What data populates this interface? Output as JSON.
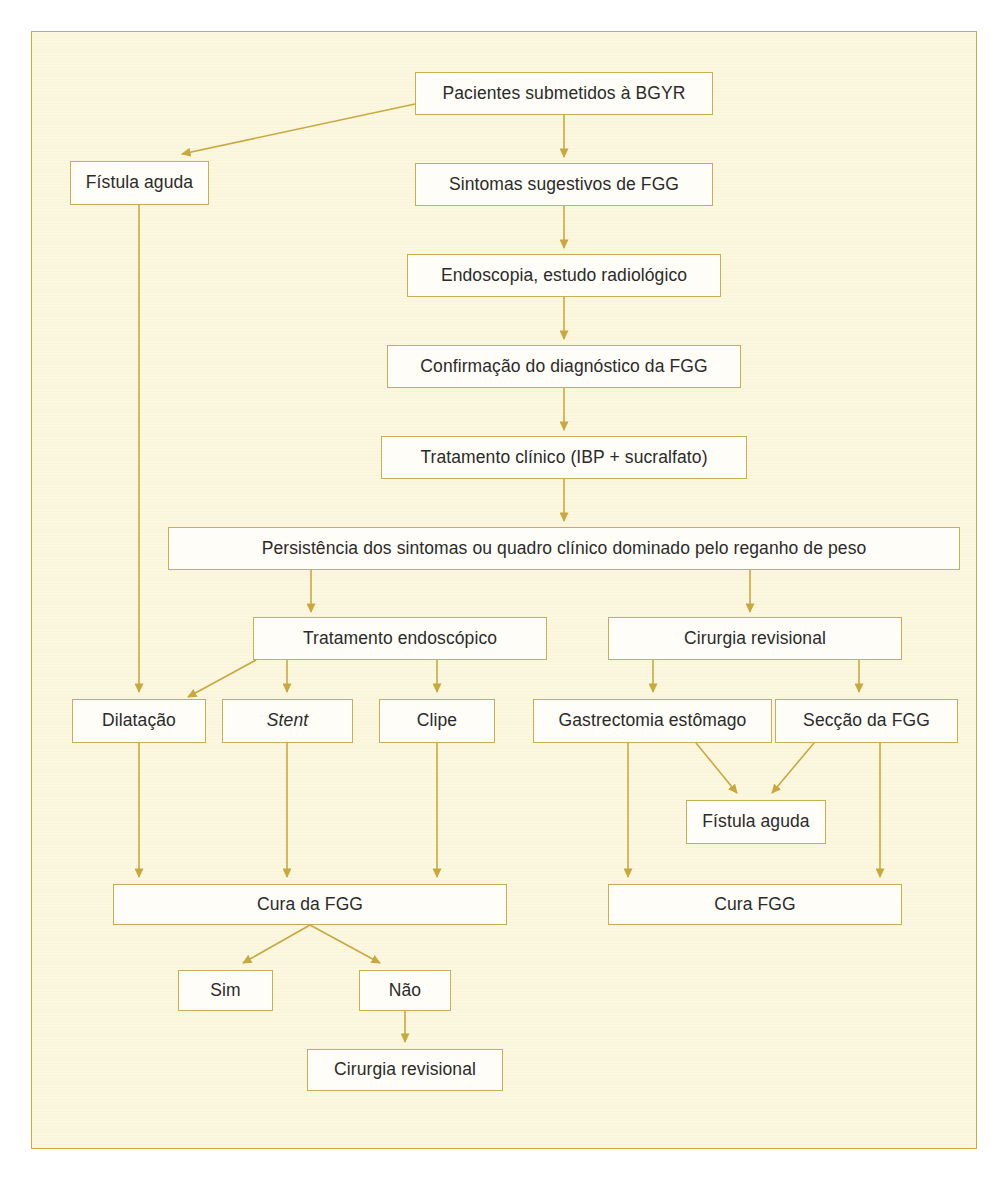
{
  "figure": {
    "kind": "clinical-flowchart",
    "language": "pt-BR",
    "palette": {
      "page_background": "#ffffff",
      "panel_background": "#fcf7df",
      "frame_border": "#c8ad4e",
      "node_fill": "#fffdf7",
      "node_border": "#c9ae55",
      "connector": "#c9a93f",
      "text": "#2b2b2b"
    }
  },
  "nodes": [
    {
      "id": "pacientes",
      "label": "Pacientes submetidos à BGYR"
    },
    {
      "id": "fistula_aguda_top",
      "label": "Fístula aguda"
    },
    {
      "id": "sintomas",
      "label": "Sintomas sugestivos de FGG"
    },
    {
      "id": "endoscopia",
      "label": "Endoscopia, estudo radiológico"
    },
    {
      "id": "confirmacao",
      "label": "Confirmação do diagnóstico da FGG"
    },
    {
      "id": "tratamento_clinico",
      "label": "Tratamento clínico (IBP + sucralfato)"
    },
    {
      "id": "persistencia",
      "label": "Persistência dos sintomas ou quadro clínico dominado pelo reganho de peso"
    },
    {
      "id": "trat_endoscopico",
      "label": "Tratamento endoscópico"
    },
    {
      "id": "cirurgia_revisional_mid",
      "label": "Cirurgia revisional"
    },
    {
      "id": "dilatacao",
      "label": "Dilatação"
    },
    {
      "id": "stent",
      "label": "Stent"
    },
    {
      "id": "clipe",
      "label": "Clipe"
    },
    {
      "id": "gastrectomia",
      "label": "Gastrectomia estômago"
    },
    {
      "id": "seccao",
      "label": "Secção da FGG"
    },
    {
      "id": "fistula_aguda_low",
      "label": "Fístula aguda"
    },
    {
      "id": "cura_da_fgg",
      "label": "Cura da FGG"
    },
    {
      "id": "cura_fgg",
      "label": "Cura FGG"
    },
    {
      "id": "sim",
      "label": "Sim"
    },
    {
      "id": "nao",
      "label": "Não"
    },
    {
      "id": "cirurgia_revisional_bottom",
      "label": "Cirurgia revisional"
    }
  ],
  "edges": [
    {
      "from": "pacientes",
      "to": "fistula_aguda_top",
      "style": "diagonal"
    },
    {
      "from": "pacientes",
      "to": "sintomas",
      "style": "straight"
    },
    {
      "from": "sintomas",
      "to": "endoscopia",
      "style": "straight"
    },
    {
      "from": "endoscopia",
      "to": "confirmacao",
      "style": "straight"
    },
    {
      "from": "confirmacao",
      "to": "tratamento_clinico",
      "style": "straight"
    },
    {
      "from": "tratamento_clinico",
      "to": "persistencia",
      "style": "straight"
    },
    {
      "from": "persistencia",
      "to": "trat_endoscopico",
      "style": "straight"
    },
    {
      "from": "persistencia",
      "to": "cirurgia_revisional_mid",
      "style": "straight"
    },
    {
      "from": "fistula_aguda_top",
      "to": "dilatacao",
      "style": "straight"
    },
    {
      "from": "trat_endoscopico",
      "to": "dilatacao",
      "style": "diagonal"
    },
    {
      "from": "trat_endoscopico",
      "to": "stent",
      "style": "straight"
    },
    {
      "from": "trat_endoscopico",
      "to": "clipe",
      "style": "straight"
    },
    {
      "from": "cirurgia_revisional_mid",
      "to": "gastrectomia",
      "style": "straight"
    },
    {
      "from": "cirurgia_revisional_mid",
      "to": "seccao",
      "style": "straight"
    },
    {
      "from": "gastrectomia",
      "to": "fistula_aguda_low",
      "style": "diagonal"
    },
    {
      "from": "seccao",
      "to": "fistula_aguda_low",
      "style": "diagonal"
    },
    {
      "from": "dilatacao",
      "to": "cura_da_fgg",
      "style": "straight"
    },
    {
      "from": "stent",
      "to": "cura_da_fgg",
      "style": "straight"
    },
    {
      "from": "clipe",
      "to": "cura_da_fgg",
      "style": "straight"
    },
    {
      "from": "gastrectomia",
      "to": "cura_fgg",
      "style": "straight"
    },
    {
      "from": "seccao",
      "to": "cura_fgg",
      "style": "straight"
    },
    {
      "from": "cura_da_fgg",
      "to": "sim",
      "style": "diagonal"
    },
    {
      "from": "cura_da_fgg",
      "to": "nao",
      "style": "diagonal"
    },
    {
      "from": "nao",
      "to": "cirurgia_revisional_bottom",
      "style": "straight"
    }
  ]
}
